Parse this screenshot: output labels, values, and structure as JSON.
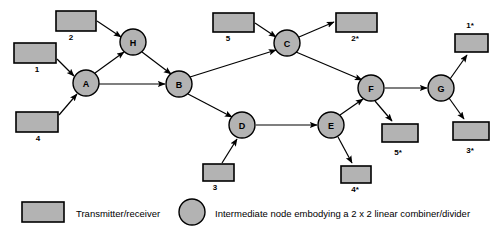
{
  "figure": {
    "type": "network-diagram",
    "title": "",
    "colors": {
      "box_fill": "#b3b3b3",
      "node_fill": "#b3b3b3",
      "stroke": "#000000",
      "background": "#ffffff"
    }
  },
  "nodes": [
    {
      "id": "A",
      "label": "A",
      "cx": 86,
      "cy": 83,
      "r": 13
    },
    {
      "id": "H",
      "label": "H",
      "cx": 133,
      "cy": 42,
      "r": 13
    },
    {
      "id": "B",
      "label": "B",
      "cx": 179,
      "cy": 84,
      "r": 13
    },
    {
      "id": "C",
      "label": "C",
      "cx": 287,
      "cy": 43,
      "r": 13
    },
    {
      "id": "D",
      "label": "D",
      "cx": 242,
      "cy": 125,
      "r": 13
    },
    {
      "id": "E",
      "label": "E",
      "cx": 331,
      "cy": 125,
      "r": 13
    },
    {
      "id": "F",
      "label": "F",
      "cx": 371,
      "cy": 88,
      "r": 13
    },
    {
      "id": "G",
      "label": "G",
      "cx": 441,
      "cy": 88,
      "r": 13
    }
  ],
  "terminals": [
    {
      "id": "t1",
      "label": "1",
      "x": 14,
      "y": 43,
      "w": 42,
      "h": 20,
      "label_x": 37,
      "label_y": 72
    },
    {
      "id": "t2",
      "label": "2",
      "x": 56,
      "y": 11,
      "w": 40,
      "h": 20,
      "label_x": 71,
      "label_y": 40
    },
    {
      "id": "t4",
      "label": "4",
      "x": 16,
      "y": 112,
      "w": 42,
      "h": 20,
      "label_x": 38,
      "label_y": 141
    },
    {
      "id": "t5",
      "label": "5",
      "x": 213,
      "y": 13,
      "w": 41,
      "h": 19,
      "label_x": 228,
      "label_y": 41
    },
    {
      "id": "t2s",
      "label": "2*",
      "x": 336,
      "y": 13,
      "w": 41,
      "h": 19,
      "label_x": 355,
      "label_y": 41
    },
    {
      "id": "t3",
      "label": "3",
      "x": 203,
      "y": 164,
      "w": 31,
      "h": 17,
      "label_x": 215,
      "label_y": 190
    },
    {
      "id": "t4s",
      "label": "4*",
      "x": 341,
      "y": 166,
      "w": 30,
      "h": 17,
      "label_x": 355,
      "label_y": 192
    },
    {
      "id": "t5s",
      "label": "5*",
      "x": 382,
      "y": 124,
      "w": 36,
      "h": 18,
      "label_x": 398,
      "label_y": 155
    },
    {
      "id": "t1s",
      "label": "1*",
      "x": 455,
      "y": 34,
      "w": 33,
      "h": 18,
      "label_x": 470,
      "label_y": 28
    },
    {
      "id": "t3s",
      "label": "3*",
      "x": 453,
      "y": 122,
      "w": 36,
      "h": 18,
      "label_x": 470,
      "label_y": 153
    }
  ],
  "edges": [
    {
      "id": "e-t2-H",
      "from": "t2",
      "to": "H",
      "x1": 97,
      "y1": 21,
      "x2": 121,
      "y2": 37
    },
    {
      "id": "e-t1-A",
      "from": "t1",
      "to": "A",
      "x1": 57,
      "y1": 59,
      "x2": 74,
      "y2": 76
    },
    {
      "id": "e-t4-A",
      "from": "t4",
      "to": "A",
      "x1": 59,
      "y1": 115,
      "x2": 77,
      "y2": 94
    },
    {
      "id": "e-A-H",
      "from": "A",
      "to": "H",
      "x1": 95,
      "y1": 73,
      "x2": 124,
      "y2": 52
    },
    {
      "id": "e-H-B",
      "from": "H",
      "to": "B",
      "x1": 142,
      "y1": 52,
      "x2": 171,
      "y2": 74
    },
    {
      "id": "e-A-B",
      "from": "A",
      "to": "B",
      "x1": 99,
      "y1": 84,
      "x2": 165,
      "y2": 84
    },
    {
      "id": "e-B-C",
      "from": "B",
      "to": "C",
      "x1": 190,
      "y1": 77,
      "x2": 276,
      "y2": 50
    },
    {
      "id": "e-B-D",
      "from": "B",
      "to": "D",
      "x1": 188,
      "y1": 94,
      "x2": 232,
      "y2": 117
    },
    {
      "id": "e-t5-C",
      "from": "t5",
      "to": "C",
      "x1": 255,
      "y1": 23,
      "x2": 276,
      "y2": 37
    },
    {
      "id": "e-C-t2s",
      "from": "C",
      "to": "t2s",
      "x1": 299,
      "y1": 37,
      "x2": 334,
      "y2": 22
    },
    {
      "id": "e-C-F",
      "from": "C",
      "to": "F",
      "x1": 296,
      "y1": 52,
      "x2": 362,
      "y2": 80
    },
    {
      "id": "e-t3-D",
      "from": "t3",
      "to": "D",
      "x1": 222,
      "y1": 163,
      "x2": 237,
      "y2": 139
    },
    {
      "id": "e-D-E",
      "from": "D",
      "to": "E",
      "x1": 256,
      "y1": 125,
      "x2": 317,
      "y2": 125
    },
    {
      "id": "e-E-F",
      "from": "E",
      "to": "F",
      "x1": 340,
      "y1": 115,
      "x2": 363,
      "y2": 99
    },
    {
      "id": "e-E-t4s",
      "from": "E",
      "to": "t4s",
      "x1": 338,
      "y1": 137,
      "x2": 352,
      "y2": 163
    },
    {
      "id": "e-F-t5s",
      "from": "F",
      "to": "t5s",
      "x1": 375,
      "y1": 101,
      "x2": 392,
      "y2": 121
    },
    {
      "id": "e-F-G",
      "from": "F",
      "to": "G",
      "x1": 385,
      "y1": 88,
      "x2": 427,
      "y2": 88
    },
    {
      "id": "e-G-t1s",
      "from": "G",
      "to": "t1s",
      "x1": 450,
      "y1": 79,
      "x2": 467,
      "y2": 55
    },
    {
      "id": "e-G-t3s",
      "from": "G",
      "to": "t3s",
      "x1": 449,
      "y1": 98,
      "x2": 464,
      "y2": 119
    }
  ],
  "legend": {
    "items": [
      {
        "id": "legend-transmitter",
        "shape": "rect",
        "label": "Transmitter/receiver",
        "swatch_x": 22,
        "swatch_y": 202,
        "swatch_w": 42,
        "swatch_h": 20,
        "text_x": 76,
        "text_y": 213
      },
      {
        "id": "legend-node",
        "shape": "circle",
        "label": "Intermediate node embodying a 2 x 2 linear combiner/divider",
        "swatch_cx": 192,
        "swatch_cy": 212,
        "swatch_r": 13,
        "text_x": 215,
        "text_y": 213
      }
    ]
  }
}
